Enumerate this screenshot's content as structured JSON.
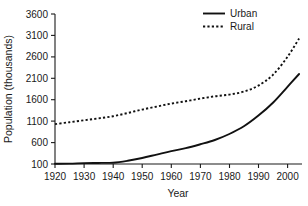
{
  "chart_data": {
    "type": "line",
    "title": "",
    "xlabel": "Year",
    "ylabel": "Population (thousands)",
    "xlim": [
      1920,
      2005
    ],
    "ylim": [
      100,
      3600
    ],
    "xticks": [
      1920,
      1930,
      1940,
      1950,
      1960,
      1970,
      1980,
      1990,
      2000
    ],
    "yticks": [
      100,
      600,
      1100,
      1600,
      2100,
      2600,
      3100,
      3600
    ],
    "xtick_labels": [
      "1920",
      "1930",
      "1940",
      "1950",
      "1960",
      "1970",
      "1980",
      "1990",
      "2000"
    ],
    "ytick_labels": [
      "100",
      "600",
      "1100",
      "1600",
      "2100",
      "2600",
      "3100",
      "3600"
    ],
    "grid": false,
    "legend_position": "top-right",
    "x": [
      1920,
      1925,
      1930,
      1935,
      1940,
      1945,
      1950,
      1955,
      1960,
      1965,
      1970,
      1975,
      1980,
      1985,
      1990,
      1995,
      2000,
      2004
    ],
    "series": [
      {
        "name": "Urban",
        "style": "solid",
        "color": "#111111",
        "values": [
          105,
          108,
          120,
          125,
          130,
          175,
          240,
          320,
          400,
          470,
          560,
          660,
          800,
          980,
          1230,
          1530,
          1900,
          2200
        ]
      },
      {
        "name": "Rural",
        "style": "dotted",
        "color": "#111111",
        "values": [
          1030,
          1075,
          1120,
          1165,
          1215,
          1290,
          1370,
          1440,
          1510,
          1565,
          1625,
          1680,
          1720,
          1790,
          1930,
          2180,
          2600,
          3030
        ]
      }
    ],
    "legend": [
      {
        "label": "Urban",
        "style": "solid"
      },
      {
        "label": "Rural",
        "style": "dotted"
      }
    ]
  }
}
